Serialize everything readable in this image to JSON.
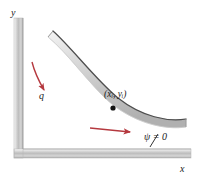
{
  "figure": {
    "background_color": "#ffffff"
  },
  "axes": {
    "x_label": "x",
    "y_label": "y",
    "bar_color": "#c8c8c8",
    "bar_highlight": "#f2f2f2",
    "bar_shadow": "#9a9a9a",
    "vertical": {
      "x": 14,
      "y_top": 18,
      "y_bottom": 158,
      "width": 9
    },
    "horizontal": {
      "y": 149,
      "x_left": 14,
      "x_right": 191,
      "height": 9
    }
  },
  "shell": {
    "name": "curved-shell-band",
    "fill_color": "#cdcdcd",
    "highlight_color": "#ebebeb",
    "edge_color": "#4a4a4a",
    "thickness": 8,
    "start_point": [
      53,
      31
    ],
    "end_point": [
      186,
      119
    ]
  },
  "annotations": {
    "point_label": "(xᵢ, yᵢ)",
    "point_label_x": 104,
    "point_label_y": 97,
    "point_marker": {
      "cx": 113,
      "cy": 108,
      "r": 2.6,
      "color": "#111111"
    },
    "load_label": "q",
    "load_label_x": 39,
    "load_label_y": 98,
    "boundary_label": "ψ = 0",
    "boundary_label_x": 144,
    "boundary_label_y": 140
  },
  "arrows": {
    "color": "#b5393f",
    "curved_load_arrow": {
      "name": "curved-load-arrow",
      "path": "M 32 62 C 35 74, 40 83, 44 90"
    },
    "straight_flow_arrow": {
      "name": "straight-flow-arrow",
      "path": "M 90 128 L 130 132"
    },
    "leader_line": {
      "name": "boundary-leader-line",
      "path": "M 150 145 L 157 133",
      "color": "#1a1a1a"
    }
  }
}
